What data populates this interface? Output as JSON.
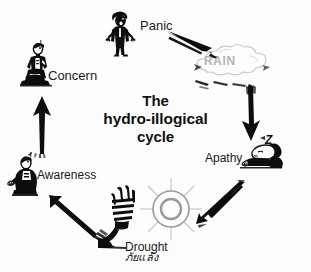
{
  "diagram": {
    "title_lines": [
      "The",
      "hydro-illogical",
      "cycle"
    ],
    "title_full": "The hydro-illogical cycle",
    "background_color": "#fdfdfd",
    "ink_color": "#0d0d0d",
    "faded_color": "#b4b4b4"
  },
  "stages": [
    {
      "id": "rain",
      "label": "RAIN",
      "icon": "rain-cloud-icon",
      "label_color": "#b4b4b4",
      "position": "top-right"
    },
    {
      "id": "apathy",
      "label": "Apathy",
      "icon": "sleeping-person-icon",
      "annotation": "Z",
      "position": "right"
    },
    {
      "id": "drought",
      "label": "Drought",
      "label_secondary": "ภัยแล้ง",
      "icon": "sun-and-wilted-plant-icon",
      "position": "bottom"
    },
    {
      "id": "awareness",
      "label": "Awareness",
      "icon": "person-looking-up-icon",
      "position": "left"
    },
    {
      "id": "concern",
      "label": "Concern",
      "icon": "kneeling-praying-person-icon",
      "position": "upper-left"
    },
    {
      "id": "panic",
      "label": "Panic",
      "icon": "panicking-person-icon",
      "position": "top"
    }
  ],
  "arrows": [
    {
      "id": "arrow-concern-to-panic",
      "direction": "up-right",
      "from": "concern",
      "to": "panic"
    },
    {
      "id": "arrow-panic-to-rain",
      "direction": "down-right",
      "from": "panic",
      "to": "rain"
    },
    {
      "id": "arrow-rain-to-apathy",
      "direction": "down",
      "from": "rain",
      "to": "apathy"
    },
    {
      "id": "arrow-apathy-to-drought",
      "direction": "down-left",
      "from": "apathy",
      "to": "drought"
    },
    {
      "id": "arrow-drought-to-awareness",
      "direction": "up-left",
      "from": "drought",
      "to": "awareness"
    },
    {
      "id": "arrow-awareness-to-concern",
      "direction": "up",
      "from": "awareness",
      "to": "concern"
    }
  ]
}
